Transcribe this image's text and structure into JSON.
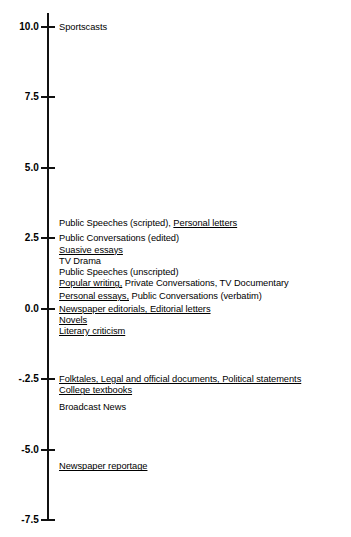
{
  "chart_data": {
    "type": "scatter",
    "title": "",
    "xlabel": "",
    "ylabel": "",
    "ylim": [
      -7.5,
      10.0
    ],
    "grid": false,
    "legend": null,
    "axis": {
      "orientation": "vertical",
      "tick_values": [
        10.0,
        7.5,
        5.0,
        2.5,
        0.0,
        -2.5,
        -5.0,
        -7.5
      ],
      "tick_labels": [
        "10.0",
        "7.5",
        "5.0",
        "2.5",
        "0.0",
        "-.2.5",
        "-5.0",
        "-7.5"
      ]
    },
    "points": [
      {
        "value": 10.0,
        "labels": [
          {
            "text": "Sportscasts",
            "underline": false
          }
        ]
      },
      {
        "value": 3.05,
        "labels": [
          {
            "text": "Public Speeches (scripted), ",
            "underline": false
          },
          {
            "text": "Personal letters",
            "underline": true
          }
        ]
      },
      {
        "value": 2.5,
        "labels": [
          {
            "text": "Public Conversations (edited)",
            "underline": false
          }
        ]
      },
      {
        "value": 2.1,
        "labels": [
          {
            "text": "Suasive essays",
            "underline": true
          }
        ]
      },
      {
        "value": 1.7,
        "labels": [
          {
            "text": "TV Drama",
            "underline": false
          }
        ]
      },
      {
        "value": 1.3,
        "labels": [
          {
            "text": "Public Speeches (unscripted)",
            "underline": false
          }
        ]
      },
      {
        "value": 0.9,
        "labels": [
          {
            "text": "Popular writing,",
            "underline": true
          },
          {
            "text": " Private Conversations, TV Documentary",
            "underline": false
          }
        ]
      },
      {
        "value": 0.45,
        "labels": [
          {
            "text": "Personal essays,",
            "underline": true
          },
          {
            "text": " Public Conversations (verbatim)",
            "underline": false
          }
        ]
      },
      {
        "value": 0.0,
        "labels": [
          {
            "text": "Newspaper editorials, Editorial letters",
            "underline": true
          }
        ]
      },
      {
        "value": -0.4,
        "labels": [
          {
            "text": "Novels",
            "underline": true
          }
        ]
      },
      {
        "value": -0.8,
        "labels": [
          {
            "text": "Literary criticism",
            "underline": true
          }
        ]
      },
      {
        "value": -2.5,
        "labels": [
          {
            "text": "Folktales, Legal and official documents, Political statements",
            "underline": true
          }
        ]
      },
      {
        "value": -2.9,
        "labels": [
          {
            "text": "College textbooks",
            "underline": true
          }
        ]
      },
      {
        "value": -3.5,
        "labels": [
          {
            "text": "Broadcast News",
            "underline": false
          }
        ]
      },
      {
        "value": -5.6,
        "labels": [
          {
            "text": "Newspaper reportage",
            "underline": true
          }
        ]
      }
    ]
  }
}
